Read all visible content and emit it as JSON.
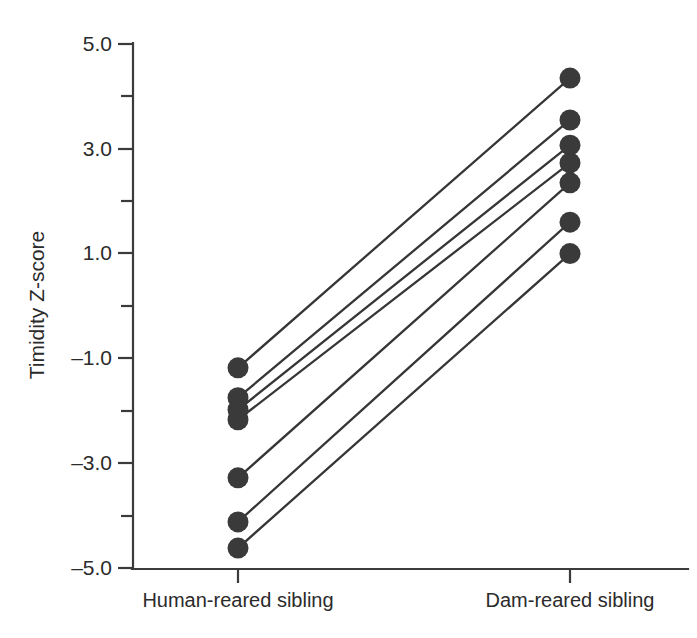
{
  "chart_data": {
    "type": "line",
    "title": "",
    "xlabel": "",
    "ylabel": "Timidity Z-score",
    "categories": [
      "Human-reared sibling",
      "Dam-reared sibling"
    ],
    "ylim": [
      -5.0,
      5.0
    ],
    "xlim": [
      0,
      1
    ],
    "grid": false,
    "legend": "none",
    "y_ticks_major": [
      "5.0",
      "3.0",
      "1.0",
      "-1.0",
      "-3.0",
      "-5.0"
    ],
    "y_tick_values_major": [
      5.0,
      3.0,
      1.0,
      -1.0,
      -3.0,
      -5.0
    ],
    "y_tick_values_minor": [
      4.0,
      2.0,
      0.0,
      -2.0,
      -4.0
    ],
    "series": [
      {
        "name": "pair-1",
        "values": [
          -1.18,
          4.35
        ]
      },
      {
        "name": "pair-2",
        "values": [
          -1.75,
          3.55
        ]
      },
      {
        "name": "pair-3",
        "values": [
          -1.98,
          3.07
        ]
      },
      {
        "name": "pair-4",
        "values": [
          -2.17,
          2.73
        ]
      },
      {
        "name": "pair-5",
        "values": [
          -3.28,
          2.35
        ]
      },
      {
        "name": "pair-6",
        "values": [
          -4.12,
          1.6
        ]
      },
      {
        "name": "pair-7",
        "values": [
          -4.62,
          1.0
        ]
      }
    ]
  },
  "axes": {
    "y_title": "Timidity Z-score",
    "x_tick_left": "Human-reared sibling",
    "x_tick_right": "Dam-reared sibling",
    "y_labels": {
      "t5": "5.0",
      "t3": "3.0",
      "t1": "1.0",
      "tm1": "–1.0",
      "tm3": "–3.0",
      "tm5": "–5.0"
    }
  },
  "colors": {
    "marker": "#3a3a3a",
    "line": "#363636",
    "axis": "#3b3b3b",
    "text": "#2b2b2b",
    "background": "#ffffff"
  }
}
